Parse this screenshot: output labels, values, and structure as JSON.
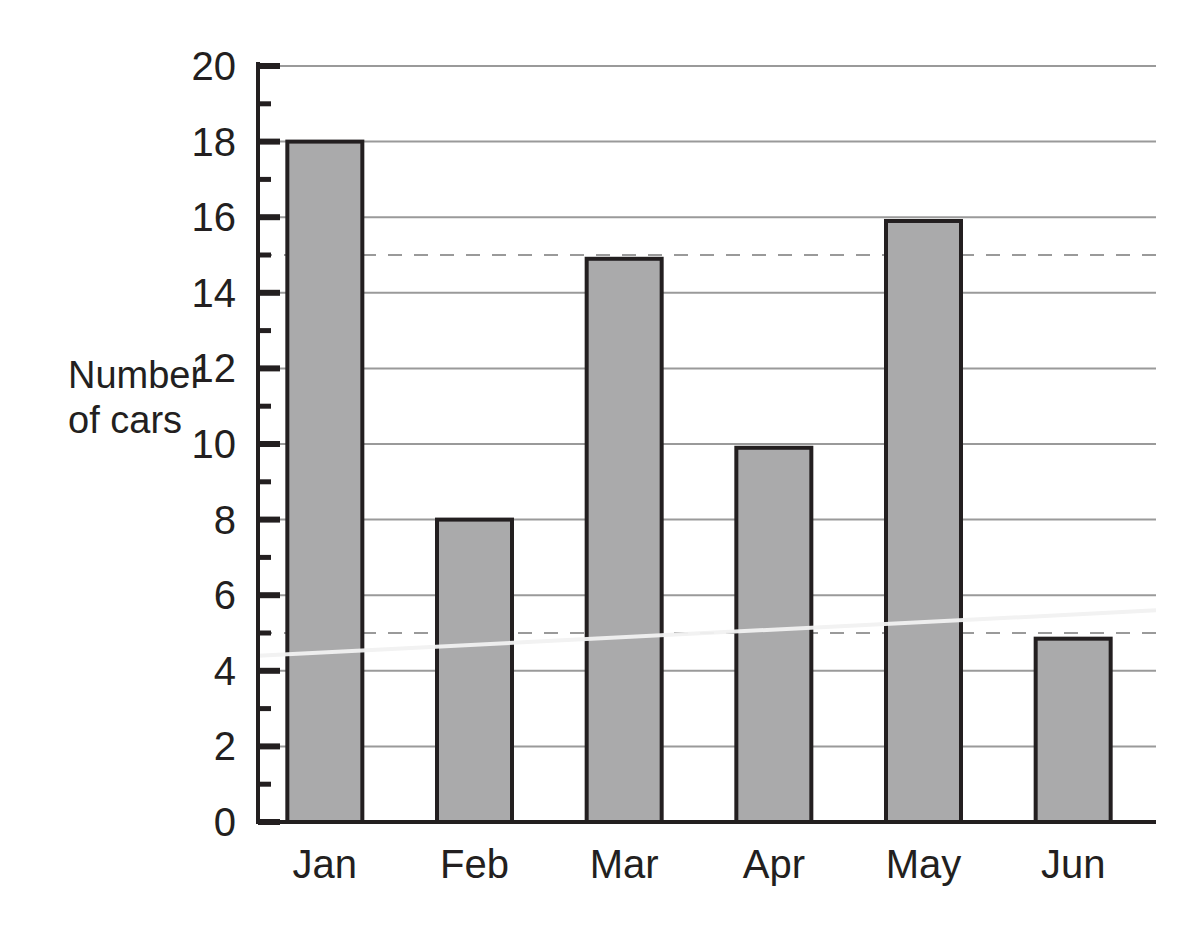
{
  "chart_data": {
    "type": "bar",
    "title": "",
    "subtitle": "",
    "xlabel": "",
    "ylabel": "Number of cars",
    "ylabel_lines": [
      "Number",
      "of cars"
    ],
    "categories": [
      "Jan",
      "Feb",
      "Mar",
      "Apr",
      "May",
      "Jun"
    ],
    "values": [
      18,
      8,
      14.9,
      9.9,
      15.9,
      4.85
    ],
    "series": [
      {
        "name": "Number of cars",
        "values": [
          18,
          8,
          14.9,
          9.9,
          15.9,
          4.85
        ]
      }
    ],
    "ylim": [
      0,
      20
    ],
    "xlim": [
      0,
      6
    ],
    "y_major_ticks": [
      0,
      2,
      4,
      6,
      8,
      10,
      12,
      14,
      16,
      18,
      20
    ],
    "y_minor_ticks": [
      1,
      3,
      5,
      7,
      9,
      11,
      13,
      15,
      17,
      19
    ],
    "y_tick_labels": [
      "0",
      "2",
      "4",
      "6",
      "8",
      "10",
      "12",
      "14",
      "16",
      "18",
      "20"
    ],
    "dashed_gridlines": [
      5,
      15
    ],
    "grid": true,
    "grid_axis": "y",
    "legend": false,
    "legend_position": "none",
    "bar_fill_color": "#aaaaab",
    "bar_edge_color": "#231f20",
    "gridline_color": "#9a9a9a",
    "axis_color": "#231f20",
    "background_color": "#ffffff",
    "annotations": [
      {
        "name": "white-trend-line",
        "type": "line",
        "color": "#f2f2f2",
        "x_start": 0,
        "y_start": 4.4,
        "x_end": 6,
        "y_end": 5.6
      }
    ]
  }
}
